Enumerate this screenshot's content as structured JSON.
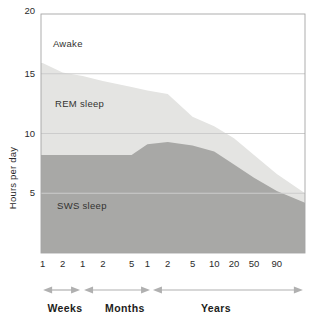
{
  "chart_data": {
    "type": "area",
    "title": "",
    "ylabel": "Hours per day",
    "xlabel": "",
    "ylim": [
      0,
      20
    ],
    "y_ticks": [
      5,
      10,
      15,
      20
    ],
    "y_gridlines": [
      5,
      10,
      15
    ],
    "grid": "on",
    "legend_position": "labels drawn inside stacked areas",
    "x_axis": {
      "scale": "piecewise-log age axis",
      "ticks": [
        {
          "label": "1",
          "unit": "weeks",
          "pos": 0.006
        },
        {
          "label": "2",
          "unit": "weeks",
          "pos": 0.082
        },
        {
          "label": "1",
          "unit": "months",
          "pos": 0.158
        },
        {
          "label": "2",
          "unit": "months",
          "pos": 0.234
        },
        {
          "label": "5",
          "unit": "months",
          "pos": 0.343
        },
        {
          "label": "1",
          "unit": "years",
          "pos": 0.403
        },
        {
          "label": "2",
          "unit": "years",
          "pos": 0.48
        },
        {
          "label": "5",
          "unit": "years",
          "pos": 0.574
        },
        {
          "label": "10",
          "unit": "years",
          "pos": 0.656
        },
        {
          "label": "20",
          "unit": "years",
          "pos": 0.731
        },
        {
          "label": "50",
          "unit": "years",
          "pos": 0.807
        },
        {
          "label": "90",
          "unit": "years",
          "pos": 0.893
        }
      ],
      "groups": [
        {
          "label": "Weeks",
          "span": [
            0.008,
            0.148
          ],
          "label_pos": 0.091
        },
        {
          "label": "Months",
          "span": [
            0.163,
            0.413
          ],
          "label_pos": 0.318
        },
        {
          "label": "Years",
          "span": [
            0.424,
            0.992
          ],
          "label_pos": 0.663
        }
      ]
    },
    "x_points_age": [
      "start",
      "1 week",
      "2 weeks",
      "1 month",
      "2 months",
      "5 months",
      "1 year",
      "2 years",
      "5 years",
      "10 years",
      "20 years",
      "50 years",
      "90 years",
      "right edge"
    ],
    "x_points_pos": [
      0,
      0.006,
      0.082,
      0.158,
      0.234,
      0.343,
      0.403,
      0.48,
      0.574,
      0.656,
      0.731,
      0.807,
      0.893,
      1.0
    ],
    "series": [
      {
        "name": "Total sleep (top of REM sleep band; region above is Awake)",
        "values": [
          15.9,
          15.9,
          15.1,
          14.8,
          14.4,
          13.9,
          13.6,
          13.3,
          11.4,
          10.6,
          9.6,
          8.2,
          6.6,
          5.0
        ],
        "fill": "#e4e4e2"
      },
      {
        "name": "SWS sleep (top of dark band; REM sleep = band between curves)",
        "values": [
          8.2,
          8.2,
          8.2,
          8.2,
          8.2,
          8.2,
          9.1,
          9.3,
          9.0,
          8.5,
          7.4,
          6.3,
          5.2,
          4.2
        ],
        "fill": "#a8a8a6"
      }
    ],
    "annotations": [
      {
        "text": "Awake",
        "x": 0.045,
        "y": 17.5
      },
      {
        "text": "REM sleep",
        "x": 0.053,
        "y": 12.5
      },
      {
        "text": "SWS sleep",
        "x": 0.061,
        "y": 3.9
      }
    ],
    "colors": {
      "rem_fill": "#e4e4e2",
      "sws_fill": "#a8a8a6",
      "background": "#ffffff",
      "gridline": "#cccccc",
      "axis_border": "#a5a5a5",
      "arrow": "#b0b0b0",
      "text": "#2b2b2b"
    }
  }
}
